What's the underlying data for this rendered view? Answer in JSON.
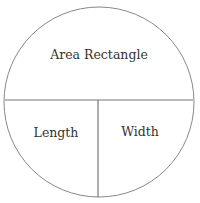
{
  "diagram": {
    "type": "area-formula-circle",
    "top": "Area Rectangle",
    "bottom_left": "Length",
    "bottom_right": "Width",
    "stroke_color": "#888888",
    "text_color": "#333333"
  }
}
